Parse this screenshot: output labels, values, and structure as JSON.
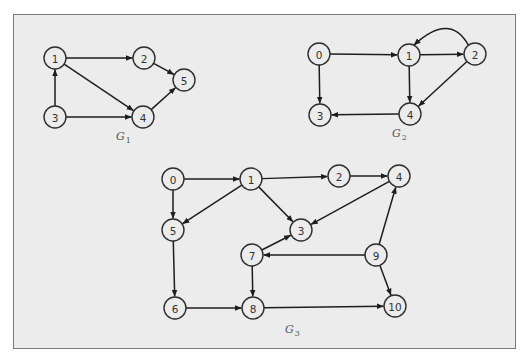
{
  "node_radius": 11,
  "colors": {
    "edge": "#1e1e1e",
    "node_stroke": "#2e2e2e",
    "fill": "#ececec",
    "frame_border": "#7a7a7a"
  },
  "graphs": [
    {
      "id": "G1",
      "label": {
        "base": "G",
        "sub": "1",
        "x": 116,
        "y": 140
      },
      "nodes": [
        {
          "id": "1",
          "label": "1",
          "x": 55,
          "y": 58
        },
        {
          "id": "2",
          "label": "2",
          "x": 144,
          "y": 58
        },
        {
          "id": "5",
          "label": "5",
          "x": 184,
          "y": 80
        },
        {
          "id": "3",
          "label": "3",
          "x": 55,
          "y": 117
        },
        {
          "id": "4",
          "label": "4",
          "x": 143,
          "y": 117
        }
      ],
      "edges": [
        {
          "from": "1",
          "to": "2"
        },
        {
          "from": "2",
          "to": "5"
        },
        {
          "from": "1",
          "to": "4"
        },
        {
          "from": "3",
          "to": "1"
        },
        {
          "from": "3",
          "to": "4"
        },
        {
          "from": "4",
          "to": "5"
        }
      ]
    },
    {
      "id": "G2",
      "label": {
        "base": "G",
        "sub": "2",
        "x": 392,
        "y": 137
      },
      "nodes": [
        {
          "id": "0",
          "label": "0",
          "x": 319,
          "y": 54
        },
        {
          "id": "1",
          "label": "1",
          "x": 409,
          "y": 55
        },
        {
          "id": "2",
          "label": "2",
          "x": 475,
          "y": 54
        },
        {
          "id": "3",
          "label": "3",
          "x": 320,
          "y": 115
        },
        {
          "id": "4",
          "label": "4",
          "x": 410,
          "y": 114
        }
      ],
      "edges": [
        {
          "from": "0",
          "to": "1"
        },
        {
          "from": "1",
          "to": "2"
        },
        {
          "from": "2",
          "to": "1",
          "curved": true
        },
        {
          "from": "0",
          "to": "3"
        },
        {
          "from": "1",
          "to": "4"
        },
        {
          "from": "2",
          "to": "4"
        },
        {
          "from": "4",
          "to": "3"
        }
      ]
    },
    {
      "id": "G3",
      "label": {
        "base": "G",
        "sub": "3",
        "x": 285,
        "y": 333
      },
      "nodes": [
        {
          "id": "0",
          "label": "0",
          "x": 173,
          "y": 179
        },
        {
          "id": "1",
          "label": "1",
          "x": 251,
          "y": 179
        },
        {
          "id": "2",
          "label": "2",
          "x": 339,
          "y": 176
        },
        {
          "id": "4",
          "label": "4",
          "x": 399,
          "y": 176
        },
        {
          "id": "5",
          "label": "5",
          "x": 173,
          "y": 230
        },
        {
          "id": "3",
          "label": "3",
          "x": 301,
          "y": 230
        },
        {
          "id": "7",
          "label": "7",
          "x": 252,
          "y": 255
        },
        {
          "id": "9",
          "label": "9",
          "x": 376,
          "y": 255
        },
        {
          "id": "6",
          "label": "6",
          "x": 175,
          "y": 308
        },
        {
          "id": "8",
          "label": "8",
          "x": 253,
          "y": 308
        },
        {
          "id": "10",
          "label": "10",
          "x": 395,
          "y": 306
        }
      ],
      "edges": [
        {
          "from": "0",
          "to": "1"
        },
        {
          "from": "0",
          "to": "5"
        },
        {
          "from": "1",
          "to": "2"
        },
        {
          "from": "1",
          "to": "5"
        },
        {
          "from": "1",
          "to": "3"
        },
        {
          "from": "2",
          "to": "4"
        },
        {
          "from": "4",
          "to": "3"
        },
        {
          "from": "5",
          "to": "6"
        },
        {
          "from": "6",
          "to": "8"
        },
        {
          "from": "7",
          "to": "3"
        },
        {
          "from": "7",
          "to": "8"
        },
        {
          "from": "9",
          "to": "7"
        },
        {
          "from": "9",
          "to": "4"
        },
        {
          "from": "9",
          "to": "10"
        },
        {
          "from": "8",
          "to": "10"
        }
      ]
    }
  ]
}
